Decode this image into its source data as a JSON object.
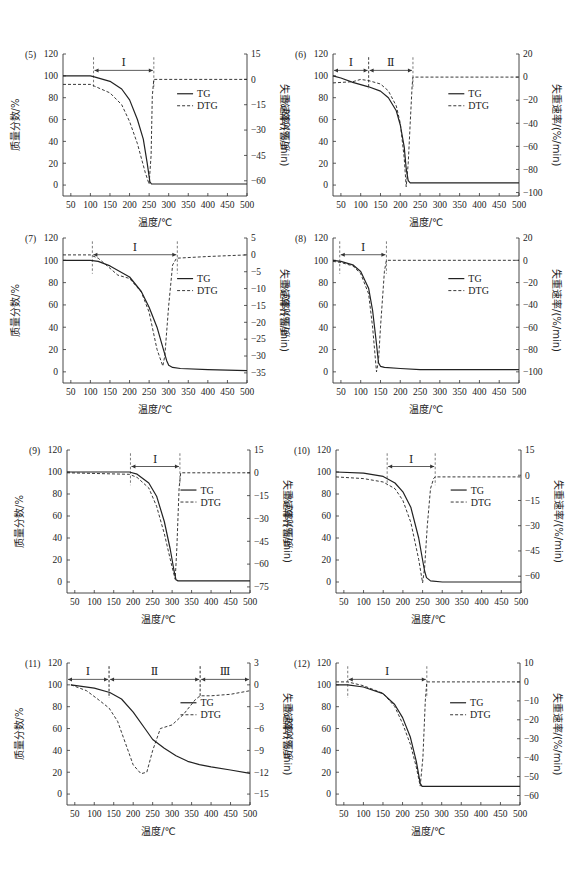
{
  "figure": {
    "x_axis_label": "温度/℃",
    "y_left_label": "质量分数/%",
    "y_right_label": "失重速率/(%/min)",
    "legend": [
      "TG",
      "DTG"
    ],
    "x_ticks": [
      50,
      100,
      150,
      200,
      250,
      300,
      350,
      400,
      450,
      500
    ],
    "y_left_ticks": [
      0,
      20,
      40,
      60,
      80,
      100,
      120
    ]
  },
  "chart_data": [
    {
      "id": "(5)",
      "type": "line",
      "xlabel": "温度/℃",
      "ylabel": "质量分数/%",
      "y2label": "失重速率/(%/min)",
      "xlim": [
        30,
        500
      ],
      "ylim": [
        -10,
        120
      ],
      "y2lim": [
        -69,
        15
      ],
      "y2_ticks": [
        15,
        0,
        -15,
        -30,
        -45,
        -60
      ],
      "stages": [
        {
          "label": "Ⅰ",
          "start": 108,
          "end": 262
        }
      ],
      "series": [
        {
          "name": "TG",
          "x": [
            30,
            100,
            110,
            150,
            180,
            200,
            220,
            235,
            245,
            252,
            256,
            260,
            300,
            400,
            500
          ],
          "y": [
            100,
            100,
            99,
            95,
            88,
            78,
            60,
            42,
            20,
            3,
            1,
            1,
            1,
            1,
            1
          ]
        },
        {
          "name": "DTG",
          "x": [
            30,
            100,
            110,
            150,
            180,
            200,
            220,
            240,
            250,
            255,
            258,
            262,
            300,
            400,
            500
          ],
          "y": [
            -3,
            -3,
            -4,
            -8,
            -15,
            -25,
            -38,
            -55,
            -62,
            -45,
            -10,
            0,
            0,
            0,
            0
          ]
        }
      ]
    },
    {
      "id": "(6)",
      "type": "line",
      "xlabel": "温度/℃",
      "ylabel": "质量分数/%",
      "y2label": "失重速率/(%/min)",
      "xlim": [
        30,
        500
      ],
      "ylim": [
        -10,
        120
      ],
      "y2lim": [
        -103,
        20
      ],
      "y2_ticks": [
        20,
        0,
        -20,
        -40,
        -60,
        -80,
        -100
      ],
      "stages": [
        {
          "label": "Ⅰ",
          "start": 30,
          "end": 120
        },
        {
          "label": "Ⅱ",
          "start": 120,
          "end": 232
        }
      ],
      "series": [
        {
          "name": "TG",
          "x": [
            30,
            50,
            80,
            100,
            120,
            150,
            170,
            190,
            200,
            210,
            215,
            220,
            225,
            240,
            300,
            400,
            500
          ],
          "y": [
            100,
            98,
            94,
            92,
            90,
            86,
            80,
            68,
            55,
            35,
            15,
            4,
            2,
            2,
            2,
            2,
            2
          ]
        },
        {
          "name": "DTG",
          "x": [
            30,
            80,
            100,
            120,
            150,
            170,
            190,
            200,
            210,
            215,
            220,
            225,
            230,
            232,
            300,
            400,
            500
          ],
          "y": [
            -5,
            -4,
            -2,
            -3,
            -6,
            -12,
            -25,
            -40,
            -70,
            -95,
            -75,
            -40,
            -8,
            0,
            0,
            0,
            0
          ]
        }
      ]
    },
    {
      "id": "(7)",
      "type": "line",
      "xlabel": "温度/℃",
      "ylabel": "质量分数/%",
      "y2label": "失重速率/(%/min)",
      "xlim": [
        30,
        500
      ],
      "ylim": [
        -10,
        120
      ],
      "y2lim": [
        -38,
        5
      ],
      "y2_ticks": [
        5,
        0,
        -5,
        -10,
        -15,
        -20,
        -25,
        -30,
        -35
      ],
      "stages": [
        {
          "label": "Ⅰ",
          "start": 105,
          "end": 322
        }
      ],
      "series": [
        {
          "name": "TG",
          "x": [
            30,
            100,
            120,
            150,
            200,
            230,
            250,
            270,
            285,
            295,
            300,
            310,
            330,
            400,
            500
          ],
          "y": [
            100,
            100,
            99,
            95,
            85,
            72,
            58,
            40,
            22,
            10,
            6,
            4,
            3,
            2,
            1
          ]
        },
        {
          "name": "DTG",
          "x": [
            30,
            100,
            120,
            150,
            170,
            200,
            230,
            250,
            270,
            285,
            290,
            300,
            310,
            320,
            400,
            500
          ],
          "y": [
            0,
            0,
            -1,
            -4,
            -6,
            -7,
            -11,
            -17,
            -28,
            -33,
            -30,
            -15,
            -3,
            -1,
            -0.5,
            0
          ]
        }
      ]
    },
    {
      "id": "(8)",
      "type": "line",
      "xlabel": "温度/℃",
      "ylabel": "质量分数/%",
      "y2label": "失重速率/(%/min)",
      "xlim": [
        30,
        500
      ],
      "ylim": [
        -10,
        120
      ],
      "y2lim": [
        -110,
        20
      ],
      "y2_ticks": [
        20,
        0,
        -20,
        -40,
        -60,
        -80,
        -100
      ],
      "stages": [
        {
          "label": "Ⅰ",
          "start": 47,
          "end": 165
        }
      ],
      "series": [
        {
          "name": "TG",
          "x": [
            30,
            50,
            80,
            100,
            120,
            130,
            140,
            145,
            150,
            160,
            200,
            250,
            500
          ],
          "y": [
            100,
            99,
            96,
            90,
            75,
            55,
            25,
            8,
            5,
            4,
            3,
            2,
            2
          ]
        },
        {
          "name": "DTG",
          "x": [
            30,
            50,
            80,
            100,
            120,
            130,
            140,
            145,
            150,
            160,
            165,
            200,
            500
          ],
          "y": [
            -1,
            -2,
            -5,
            -12,
            -30,
            -60,
            -100,
            -90,
            -60,
            -10,
            0,
            0,
            0
          ]
        }
      ]
    },
    {
      "id": "(9)",
      "type": "line",
      "xlabel": "温度/℃",
      "ylabel": "质量分数/%",
      "y2label": "失重速率/(%/min)",
      "xlim": [
        30,
        500
      ],
      "ylim": [
        -10,
        120
      ],
      "y2lim": [
        -79,
        15
      ],
      "y2_ticks": [
        15,
        0,
        -15,
        -30,
        -45,
        -60,
        -75
      ],
      "stages": [
        {
          "label": "Ⅰ",
          "start": 193,
          "end": 320
        }
      ],
      "series": [
        {
          "name": "TG",
          "x": [
            30,
            190,
            210,
            240,
            260,
            280,
            295,
            305,
            310,
            315,
            350,
            500
          ],
          "y": [
            100,
            100,
            98,
            90,
            78,
            55,
            30,
            10,
            2,
            1,
            1,
            1
          ]
        },
        {
          "name": "DTG",
          "x": [
            30,
            190,
            210,
            240,
            260,
            280,
            300,
            308,
            312,
            318,
            322,
            500
          ],
          "y": [
            0,
            -1,
            -3,
            -10,
            -22,
            -40,
            -62,
            -70,
            -50,
            -10,
            0,
            0
          ]
        }
      ]
    },
    {
      "id": "(10)",
      "type": "line",
      "xlabel": "温度/℃",
      "ylabel": "质量分数/%",
      "y2label": "失重速率/(%/min)",
      "xlim": [
        30,
        500
      ],
      "ylim": [
        -10,
        120
      ],
      "y2lim": [
        -70,
        15
      ],
      "y2_ticks": [
        15,
        0,
        -15,
        -30,
        -45,
        -60
      ],
      "stages": [
        {
          "label": "Ⅰ",
          "start": 160,
          "end": 282
        }
      ],
      "series": [
        {
          "name": "TG",
          "x": [
            30,
            100,
            150,
            180,
            200,
            220,
            240,
            250,
            255,
            260,
            270,
            300,
            500
          ],
          "y": [
            100,
            99,
            96,
            90,
            82,
            68,
            40,
            20,
            10,
            4,
            1,
            0,
            0
          ]
        },
        {
          "name": "DTG",
          "x": [
            30,
            100,
            150,
            180,
            200,
            220,
            240,
            250,
            255,
            262,
            270,
            278,
            282,
            500
          ],
          "y": [
            -1,
            -2,
            -4,
            -8,
            -15,
            -28,
            -50,
            -64,
            -55,
            -30,
            -8,
            -2,
            -1,
            -1
          ]
        }
      ]
    },
    {
      "id": "(11)",
      "type": "line",
      "xlabel": "温度/℃",
      "ylabel": "质量分数/%",
      "y2label": "失重速率/(%/min)",
      "xlim": [
        30,
        500
      ],
      "ylim": [
        -10,
        120
      ],
      "y2lim": [
        -16.5,
        3
      ],
      "y2_ticks": [
        3,
        0,
        -3,
        -6,
        -9,
        -12,
        -15
      ],
      "stages": [
        {
          "label": "Ⅰ",
          "start": 30,
          "end": 138
        },
        {
          "label": "Ⅱ",
          "start": 138,
          "end": 372
        },
        {
          "label": "Ⅲ",
          "start": 372,
          "end": 500
        }
      ],
      "series": [
        {
          "name": "TG",
          "x": [
            40,
            100,
            140,
            170,
            200,
            230,
            250,
            280,
            310,
            340,
            370,
            400,
            450,
            500
          ],
          "y": [
            100,
            97,
            93,
            87,
            75,
            60,
            50,
            42,
            35,
            30,
            27,
            25,
            22,
            19
          ]
        },
        {
          "name": "DTG",
          "x": [
            40,
            80,
            110,
            138,
            160,
            180,
            200,
            220,
            235,
            250,
            270,
            300,
            330,
            360,
            372,
            400,
            450,
            500
          ],
          "y": [
            0,
            -0.8,
            -2,
            -3.2,
            -5,
            -8,
            -11,
            -12.2,
            -12,
            -9,
            -6,
            -5.5,
            -4,
            -2,
            -1.5,
            -1.5,
            -1.3,
            -0.8
          ]
        }
      ]
    },
    {
      "id": "(12)",
      "type": "line",
      "xlabel": "温度/℃",
      "ylabel": "质量分数/%",
      "y2label": "失重速率/(%/min)",
      "xlim": [
        30,
        500
      ],
      "ylim": [
        -10,
        120
      ],
      "y2lim": [
        -65,
        10
      ],
      "y2_ticks": [
        10,
        0,
        -10,
        -20,
        -30,
        -40,
        -50,
        -60
      ],
      "stages": [
        {
          "label": "Ⅰ",
          "start": 60,
          "end": 262
        }
      ],
      "series": [
        {
          "name": "TG",
          "x": [
            30,
            60,
            100,
            150,
            180,
            200,
            220,
            235,
            245,
            250,
            260,
            300,
            500
          ],
          "y": [
            100,
            100,
            98,
            92,
            82,
            70,
            52,
            30,
            10,
            7,
            7,
            7,
            7
          ]
        },
        {
          "name": "DTG",
          "x": [
            30,
            60,
            100,
            150,
            180,
            200,
            220,
            235,
            245,
            252,
            258,
            262,
            300,
            500
          ],
          "y": [
            0,
            0,
            -2,
            -6,
            -13,
            -22,
            -33,
            -45,
            -55,
            -40,
            -10,
            0,
            0,
            0
          ]
        }
      ]
    }
  ],
  "layout": [
    {
      "left": 63,
      "right": 247,
      "top": 54,
      "bottom": 196
    },
    {
      "left": 333,
      "right": 519,
      "top": 54,
      "bottom": 196
    },
    {
      "left": 63,
      "right": 247,
      "top": 238,
      "bottom": 383
    },
    {
      "left": 333,
      "right": 519,
      "top": 238,
      "bottom": 383
    },
    {
      "left": 67,
      "right": 250,
      "top": 450,
      "bottom": 593
    },
    {
      "left": 336,
      "right": 521,
      "top": 450,
      "bottom": 593
    },
    {
      "left": 67,
      "right": 250,
      "top": 663,
      "bottom": 805
    },
    {
      "left": 336,
      "right": 520,
      "top": 663,
      "bottom": 805
    }
  ]
}
